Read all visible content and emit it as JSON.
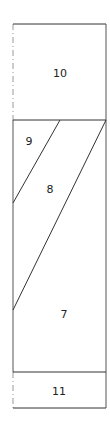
{
  "diagram": {
    "stroke_color": "#333333",
    "background": "#ffffff",
    "outer": {
      "left": 13,
      "top": 24,
      "right": 106,
      "bottom": 408
    },
    "dividers": {
      "upper_y": 120,
      "lower_y": 372
    },
    "diagonals": [
      {
        "x1": 60,
        "y1": 120,
        "x2": 13,
        "y2": 203
      },
      {
        "x1": 106,
        "y1": 120,
        "x2": 13,
        "y2": 310
      }
    ],
    "regions": [
      {
        "id": "10",
        "label": "10",
        "x": 60,
        "y": 73
      },
      {
        "id": "9",
        "label": "9",
        "x": 29,
        "y": 141
      },
      {
        "id": "8",
        "label": "8",
        "x": 50,
        "y": 189
      },
      {
        "id": "7",
        "label": "7",
        "x": 64,
        "y": 314
      },
      {
        "id": "11",
        "label": "11",
        "x": 59,
        "y": 391
      }
    ]
  }
}
